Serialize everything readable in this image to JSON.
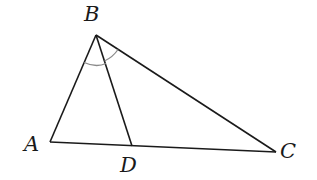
{
  "diagram": {
    "type": "triangle",
    "points": {
      "A": {
        "label": "A",
        "x": 50,
        "y": 142
      },
      "B": {
        "label": "B",
        "x": 96,
        "y": 35
      },
      "C": {
        "label": "C",
        "x": 276,
        "y": 152
      },
      "D": {
        "label": "D",
        "x": 132,
        "y": 146
      }
    },
    "segments": [
      "AB",
      "BC",
      "AC",
      "BD"
    ],
    "angle_marks": [
      "ABD",
      "DBC"
    ],
    "colors": {
      "line": "#1a1a1a",
      "arc": "#8a8a8a"
    }
  }
}
